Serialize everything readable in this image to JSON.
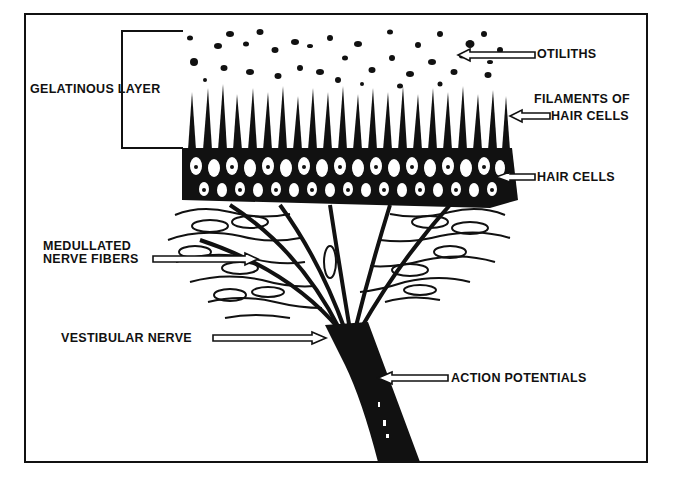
{
  "diagram": {
    "type": "anatomical-illustration",
    "labels": {
      "gelatinous_layer": "GELATINOUS LAYER",
      "otiliths": "OTILITHS",
      "filaments_line1": "FILAMENTS OF",
      "filaments_line2": "HAIR CELLS",
      "hair_cells": "HAIR CELLS",
      "medullated_line1": "MEDULLATED",
      "medullated_line2": "NERVE FIBERS",
      "vestibular_nerve": "VESTIBULAR NERVE",
      "action_potentials": "ACTION POTENTIALS"
    },
    "colors": {
      "ink": "#111111",
      "background": "#ffffff"
    }
  }
}
